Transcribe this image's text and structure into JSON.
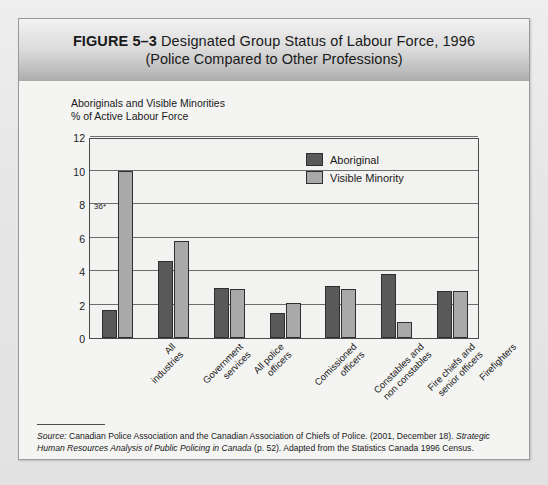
{
  "figure": {
    "number_label": "FIGURE 5–3",
    "title_line_1": "Designated Group Status of Labour Force, 1996",
    "title_line_2": "(Police Compared to Other Professions)"
  },
  "source": {
    "label": "Source:",
    "text_roman_1": " Canadian Police Association and the Canadian Association of Chiefs of Police. (2001, December 18). ",
    "text_italic_1": "Strategic Human Resources Analysis of Public Policing in Canada",
    "text_roman_2": " (p. 52). Adapted from the Statistics Canada 1996 Census."
  },
  "chart_data": {
    "type": "bar",
    "title": "Designated Group Status of Labour Force, 1996 (Police Compared to Other Professions)",
    "ylabel_line_1": "Aboriginals and Visible Minorities",
    "ylabel_line_2": "% of Active Labour Force",
    "xlabel": "",
    "ylim": [
      0,
      12
    ],
    "yticks": [
      0,
      2,
      4,
      6,
      8,
      10,
      12
    ],
    "ytick_labels": [
      "0",
      "2",
      "4",
      "6",
      "8",
      "10",
      "12"
    ],
    "grid": true,
    "legend_position": "top-right",
    "categories": [
      "All industries",
      "Government services",
      "All police officers",
      "Comissioned officers",
      "Constables and non constables",
      "Fire chiefs and senior officers",
      "Firefighters"
    ],
    "category_lines": [
      [
        "All",
        "industries"
      ],
      [
        "Government",
        "services"
      ],
      [
        "All police",
        "officers"
      ],
      [
        "Comissioned",
        "officers"
      ],
      [
        "Constables and",
        "non constables"
      ],
      [
        "Fire chiefs and",
        "senior officers"
      ],
      [
        "Firefighters"
      ]
    ],
    "series": [
      {
        "name": "Aboriginal",
        "color": "#595959",
        "values": [
          1.7,
          4.6,
          3.0,
          1.5,
          3.1,
          3.8,
          2.8
        ]
      },
      {
        "name": "Visible Minority",
        "color": "#a9a9a9",
        "values": [
          10.0,
          5.8,
          2.9,
          2.1,
          2.9,
          0.95,
          2.8
        ]
      }
    ],
    "annotations": [
      {
        "text": "36*",
        "x_category": "All industries",
        "y_value": 7.6
      }
    ]
  },
  "colors": {
    "aboriginal": "#595959",
    "visible_minority": "#a9a9a9",
    "axis": "#4b4b4b",
    "plot_background": "#f2f2f0",
    "figure_background": "#f4f4f2"
  }
}
